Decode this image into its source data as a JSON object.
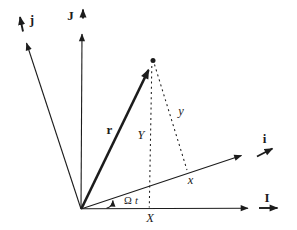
{
  "diagram": {
    "background": "#ffffff",
    "ink": "#1c1c1c",
    "labels": {
      "j_unit": "j",
      "J_unit": "J",
      "i_unit": "i",
      "I_unit": "I",
      "r_vector": "r",
      "Y_coord": "Y",
      "y_coord": "y",
      "x_coord": "x",
      "X_coord": "X",
      "angle_omega": "Ω",
      "angle_t": "t"
    }
  }
}
